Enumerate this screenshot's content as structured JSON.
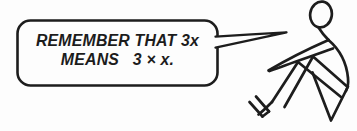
{
  "panel": {
    "type": "cartoon-illustration",
    "ink_color": "#1d1d1d",
    "background_color": "#fdfdfd",
    "speech_bubble": {
      "line1": "REMEMBER THAT 3x",
      "line2": "MEANS   3 × x."
    },
    "figure": {
      "kind": "stick-figure",
      "pose": "sitting on ground, knees bent, gesturing toward speech bubble"
    }
  }
}
